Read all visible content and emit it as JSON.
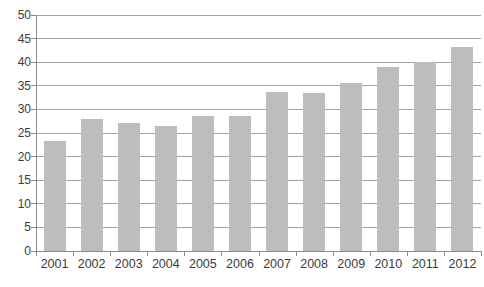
{
  "window": {
    "background": "#ffffff"
  },
  "chart_data": {
    "type": "bar",
    "title": "",
    "xlabel": "",
    "ylabel": "",
    "categories": [
      "2001",
      "2002",
      "2003",
      "2004",
      "2005",
      "2006",
      "2007",
      "2008",
      "2009",
      "2010",
      "2011",
      "2012"
    ],
    "values": [
      23.3,
      27.9,
      27.2,
      26.4,
      28.5,
      28.5,
      33.7,
      33.5,
      35.5,
      39.0,
      40.1,
      43.2
    ],
    "ylim": [
      0,
      50
    ],
    "ytick_step": 5,
    "grid": true,
    "legend": false,
    "colors": {
      "bar": "#bdbdbd",
      "gridline": "#a3a3a3",
      "axis": "#8c8c8c",
      "tick": "#8c8c8c",
      "label": "#3c3c3c",
      "background": "#ffffff"
    }
  }
}
